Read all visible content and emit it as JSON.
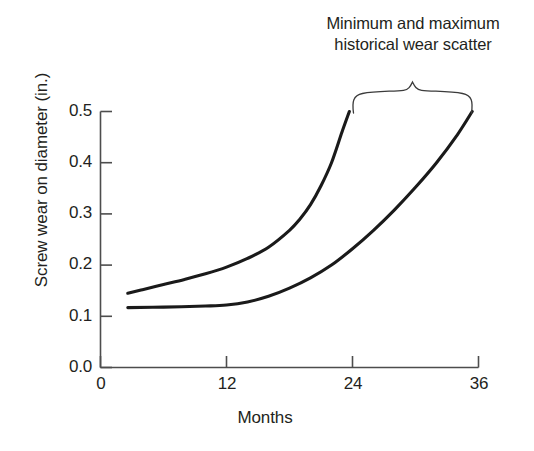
{
  "chart_data": {
    "type": "line",
    "title": "",
    "xlabel": "Months",
    "ylabel": "Screw wear on diameter (in.)",
    "xlim": [
      0,
      36
    ],
    "ylim": [
      0.0,
      0.5
    ],
    "xticks": [
      "0",
      "12",
      "24",
      "36"
    ],
    "xtick_values": [
      0,
      12,
      24,
      36
    ],
    "yticks": [
      "0.0",
      "0.1",
      "0.2",
      "0.3",
      "0.4",
      "0.5"
    ],
    "ytick_values": [
      0.0,
      0.1,
      0.2,
      0.3,
      0.4,
      0.5
    ],
    "grid": false,
    "legend": "none",
    "line_color": "#1a1a1a",
    "series": [
      {
        "name": "Maximum historical wear scatter",
        "x": [
          2.6,
          4,
          6,
          8,
          10,
          12,
          14,
          16,
          18,
          19,
          20,
          21,
          22,
          23,
          23.7
        ],
        "values": [
          0.145,
          0.152,
          0.162,
          0.172,
          0.183,
          0.196,
          0.213,
          0.235,
          0.268,
          0.29,
          0.318,
          0.355,
          0.4,
          0.46,
          0.5
        ]
      },
      {
        "name": "Minimum historical wear scatter",
        "x": [
          2.6,
          6,
          10,
          12,
          14,
          16,
          18,
          20,
          22,
          24,
          26,
          28,
          30,
          32,
          34,
          35.4
        ],
        "values": [
          0.117,
          0.118,
          0.12,
          0.122,
          0.128,
          0.139,
          0.155,
          0.175,
          0.2,
          0.232,
          0.268,
          0.308,
          0.352,
          0.4,
          0.455,
          0.5
        ]
      }
    ],
    "annotations": [
      {
        "name": "wear-scatter-brace-label",
        "lines": [
          "Minimum and maximum",
          "historical wear scatter"
        ],
        "brace_span_months": [
          24,
          36
        ]
      }
    ]
  },
  "axis": {
    "y_tick_labels": [
      "0.5",
      "0.4",
      "0.3",
      "0.2",
      "0.1",
      "0.0"
    ],
    "x_tick_labels": [
      "0",
      "12",
      "24",
      "36"
    ],
    "y_axis_title": "Screw wear on diameter (in.)",
    "x_axis_title": "Months"
  },
  "annotation": {
    "line_1": "Minimum and maximum",
    "line_2": "historical wear scatter"
  },
  "colors": {
    "ink": "#231f20",
    "curve": "#1a1a1a",
    "axis": "#4d4d4d",
    "background": "#ffffff"
  }
}
